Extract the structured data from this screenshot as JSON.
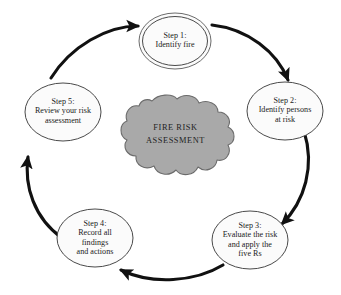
{
  "diagram": {
    "type": "circular-process-cycle",
    "center": {
      "shape": "cloud",
      "label": "FIRE RISK\nASSESSMENT",
      "line1": "FIRE RISK",
      "line2": "ASSESSMENT",
      "fill_color": "#a9a9a9",
      "stroke_color": "#6b6b6b"
    },
    "steps": [
      {
        "id": "step-1",
        "number": "Step 1:",
        "body": "Identify fire",
        "label": "Step 1:\nIdentify fire",
        "position": "top",
        "double_ring": true
      },
      {
        "id": "step-2",
        "number": "Step 2:",
        "body": "Identify persons\nat risk",
        "label": "Step 2:\nIdentify persons\nat risk",
        "position": "right",
        "double_ring": false
      },
      {
        "id": "step-3",
        "number": "Step 3:",
        "body": "Evaluate the risk\nand apply the\nfive Rs",
        "label": "Step 3:\nEvaluate the risk\nand apply the\nfive Rs",
        "position": "bottom-right",
        "double_ring": false
      },
      {
        "id": "step-4",
        "number": "Step 4:",
        "body": "Record all\nfindings\nand actions",
        "label": "Step 4:\nRecord all\nfindings\nand actions",
        "position": "bottom-left",
        "double_ring": false
      },
      {
        "id": "step-5",
        "number": "Step 5:",
        "body": "Review your risk\nassessment",
        "label": "Step 5:\nReview your risk\nassessment",
        "position": "left",
        "double_ring": false
      }
    ],
    "arrows": [
      {
        "id": "arrow-1-to-2",
        "from": "step-1",
        "to": "step-2",
        "direction": "clockwise"
      },
      {
        "id": "arrow-2-to-3",
        "from": "step-2",
        "to": "step-3",
        "direction": "clockwise"
      },
      {
        "id": "arrow-3-to-4",
        "from": "step-3",
        "to": "step-4",
        "direction": "clockwise"
      },
      {
        "id": "arrow-4-to-5",
        "from": "step-4",
        "to": "step-5",
        "direction": "clockwise"
      },
      {
        "id": "arrow-5-to-1",
        "from": "step-5",
        "to": "step-1",
        "direction": "clockwise"
      }
    ],
    "colors": {
      "background": "#ffffff",
      "node_fill": "#fbfbfb",
      "node_stroke": "#4a4a4a",
      "arrow": "#111111",
      "text": "#1a1a1a",
      "cloud_fill": "#a9a9a9",
      "cloud_stroke": "#6b6b6b"
    }
  }
}
